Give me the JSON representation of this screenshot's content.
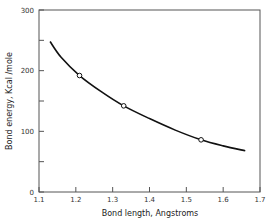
{
  "chart_data": {
    "type": "line",
    "title": "",
    "xlabel": "Bond length, Angstroms",
    "ylabel": "Bond energy, Kcal /mole",
    "xlim": [
      1.1,
      1.7
    ],
    "ylim": [
      0,
      300
    ],
    "x_ticks": [
      "1.1",
      "1.2",
      "1.3",
      "1.4",
      "1.5",
      "1.6",
      "1.7"
    ],
    "y_ticks": [
      "0",
      "100",
      "200",
      "300"
    ],
    "grid": false,
    "legend": null,
    "series": [
      {
        "name": "curve",
        "x": [
          1.13,
          1.16,
          1.21,
          1.27,
          1.33,
          1.4,
          1.47,
          1.54,
          1.6,
          1.66
        ],
        "y": [
          248,
          222,
          192,
          165,
          142,
          121,
          102,
          86,
          76,
          68
        ]
      },
      {
        "name": "points",
        "marker": "open-circle",
        "x": [
          1.21,
          1.33,
          1.54
        ],
        "y": [
          192,
          142,
          86
        ]
      }
    ]
  }
}
